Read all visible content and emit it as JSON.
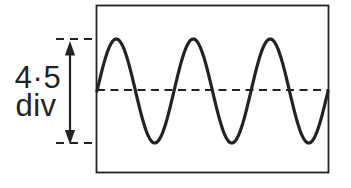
{
  "figure": {
    "kind": "oscilloscope-screen-trace",
    "amplitude_label": {
      "value": "4·5",
      "unit": "div",
      "numeric_divisions": 4.5
    },
    "waveform": {
      "shape": "sine",
      "cycles_visible": 3,
      "peak_to_peak": "4.5 div"
    },
    "colors": {
      "ink": "#232323",
      "background": "#ffffff"
    }
  }
}
